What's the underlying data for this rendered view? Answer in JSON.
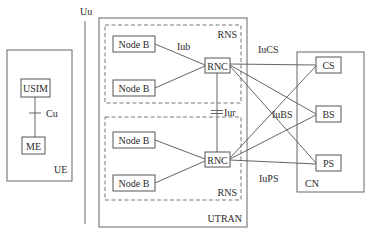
{
  "diagram": {
    "interfaces": {
      "uu": "Uu",
      "cu": "Cu",
      "iub": "Iub",
      "iur": "Iur",
      "iucs": "IuCS",
      "iubs": "IuBS",
      "iups": "IuPS"
    },
    "ue": {
      "label": "UE",
      "usim": "USIM",
      "me": "ME"
    },
    "utran": {
      "label": "UTRAN",
      "rns": [
        {
          "label": "RNS",
          "rnc": "RNC",
          "node_b": [
            "Node B",
            "Node B"
          ]
        },
        {
          "label": "RNS",
          "rnc": "RNC",
          "node_b": [
            "Node B",
            "Node B"
          ]
        }
      ]
    },
    "cn": {
      "label": "CN",
      "domains": [
        "CS",
        "BS",
        "PS"
      ]
    },
    "colors": {
      "line": "#555555",
      "text": "#2a2a2a",
      "background": "#ffffff"
    }
  }
}
